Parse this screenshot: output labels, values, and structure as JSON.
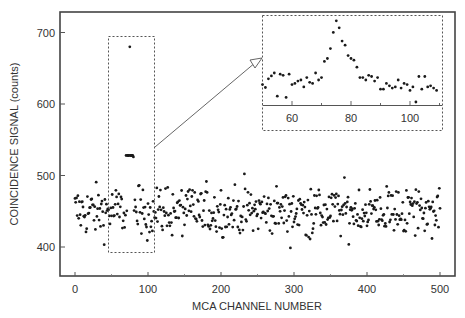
{
  "chart_data": {
    "type": "scatter",
    "title": "",
    "xlabel": "MCA CHANNEL NUMBER",
    "ylabel": "COINCIDENCE SIGNAL (counts)",
    "xlim": [
      -20,
      520
    ],
    "ylim": [
      360,
      730
    ],
    "xticks": [
      0,
      100,
      200,
      300,
      400,
      500
    ],
    "yticks": [
      400,
      500,
      600,
      700
    ],
    "grid": false,
    "legend": null,
    "colors": {
      "points": "#1a1a1a",
      "frame": "#444444",
      "dashed": "#555555",
      "text": "#333333"
    },
    "series": [
      {
        "name": "coincidence signal",
        "description": "Noisy baseline around 450 counts (range ~390-525) across channels 0-500, with a sharp peak near channel 75 reaching ~680 counts",
        "baseline_mean": 450,
        "baseline_spread": [
          390,
          525
        ],
        "peak": {
          "channel": 75,
          "value": 680
        },
        "peak_points": [
          [
            70,
            530
          ],
          [
            72,
            540
          ],
          [
            73,
            575
          ],
          [
            74,
            600
          ],
          [
            75,
            630
          ],
          [
            76,
            650
          ],
          [
            77,
            620
          ],
          [
            78,
            560
          ],
          [
            79,
            540
          ],
          [
            80,
            520
          ]
        ]
      }
    ],
    "annotations": [
      {
        "type": "dashed-rectangle",
        "x_range": [
          50,
          112
        ],
        "y_range": [
          393,
          695
        ],
        "label": "zoom region"
      },
      {
        "type": "arrow",
        "from": "zoom region",
        "to": "inset"
      }
    ],
    "inset": {
      "type": "scatter",
      "xticks": [
        60,
        80,
        100
      ],
      "xlim": [
        50,
        110
      ],
      "peak_channel": 75,
      "points": [
        [
          50,
          600
        ],
        [
          51,
          595
        ],
        [
          52,
          610
        ],
        [
          53,
          615
        ],
        [
          54,
          620
        ],
        [
          55,
          580
        ],
        [
          56,
          618
        ],
        [
          57,
          616
        ],
        [
          58,
          578
        ],
        [
          59,
          618
        ],
        [
          60,
          600
        ],
        [
          61,
          602
        ],
        [
          62,
          606
        ],
        [
          63,
          608
        ],
        [
          64,
          596
        ],
        [
          65,
          612
        ],
        [
          66,
          604
        ],
        [
          67,
          602
        ],
        [
          68,
          620
        ],
        [
          69,
          608
        ],
        [
          70,
          612
        ],
        [
          71,
          640
        ],
        [
          72,
          645
        ],
        [
          73,
          662
        ],
        [
          74,
          690
        ],
        [
          75,
          710
        ],
        [
          76,
          698
        ],
        [
          77,
          675
        ],
        [
          78,
          668
        ],
        [
          79,
          650
        ],
        [
          80,
          645
        ],
        [
          81,
          642
        ],
        [
          82,
          630
        ],
        [
          83,
          612
        ],
        [
          84,
          612
        ],
        [
          85,
          608
        ],
        [
          86,
          616
        ],
        [
          87,
          614
        ],
        [
          88,
          606
        ],
        [
          89,
          612
        ],
        [
          90,
          592
        ],
        [
          91,
          592
        ],
        [
          92,
          602
        ],
        [
          93,
          598
        ],
        [
          94,
          594
        ],
        [
          95,
          596
        ],
        [
          96,
          608
        ],
        [
          97,
          594
        ],
        [
          98,
          602
        ],
        [
          99,
          600
        ],
        [
          100,
          590
        ],
        [
          101,
          596
        ],
        [
          102,
          570
        ],
        [
          103,
          614
        ],
        [
          104,
          592
        ],
        [
          105,
          614
        ],
        [
          106,
          596
        ],
        [
          107,
          598
        ],
        [
          108,
          594
        ],
        [
          109,
          590
        ]
      ]
    }
  }
}
